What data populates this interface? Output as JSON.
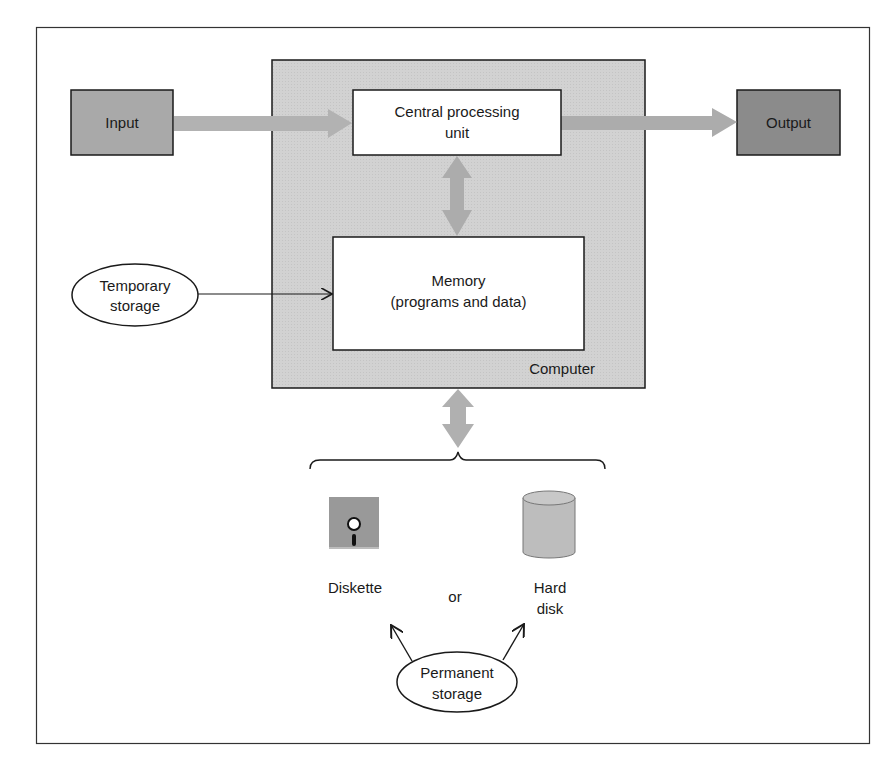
{
  "diagram": {
    "nodes": {
      "input": {
        "label": "Input"
      },
      "output": {
        "label": "Output"
      },
      "cpu": {
        "label_line1": "Central processing",
        "label_line2": "unit"
      },
      "memory": {
        "label_line1": "Memory",
        "label_line2": "(programs and data)"
      },
      "computer": {
        "label": "Computer"
      },
      "temporary_storage": {
        "label_line1": "Temporary",
        "label_line2": "storage"
      },
      "diskette": {
        "label": "Diskette"
      },
      "or": {
        "label": "or"
      },
      "hard_disk": {
        "label_line1": "Hard",
        "label_line2": "disk"
      },
      "permanent_storage": {
        "label_line1": "Permanent",
        "label_line2": "storage"
      }
    },
    "colors": {
      "computer_fill": "#d4d4d4",
      "input_fill": "#a8a8a8",
      "output_fill": "#8a8a8a",
      "arrow_fill": "#b4b4b4",
      "box_fill": "#ffffff",
      "stroke": "#1a1a1a"
    }
  }
}
